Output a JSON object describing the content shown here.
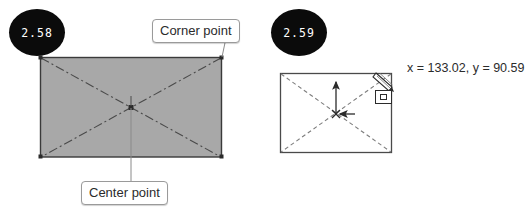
{
  "figures": [
    {
      "badge": "2.58",
      "badge_name": "step-badge-258",
      "callouts": [
        {
          "label": "Corner point",
          "target": "top-right-corner"
        },
        {
          "label": "Center point",
          "target": "rectangle-center"
        }
      ],
      "shape": {
        "type": "rectangle",
        "fill": "#a8a8a8",
        "stroke": "#3a3a3a",
        "diagonals": "dash-dot",
        "markers": [
          "corner-point-markers",
          "center-point-marker"
        ]
      }
    },
    {
      "badge": "2.59",
      "badge_name": "step-badge-259",
      "coordinate_readout": "x = 133.02, y = 90.59",
      "coordinates": {
        "x": 133.02,
        "y": 90.59
      },
      "shape": {
        "type": "rectangle",
        "fill": "#ffffff",
        "stroke": "#4a4a4a",
        "diagonals": "dashed",
        "markers": [
          "center-snap-marker",
          "up-arrow",
          "right-arrow"
        ]
      },
      "cursor": {
        "icon": "pen-cursor-icon",
        "snap_marker": "snap-box-icon"
      }
    }
  ],
  "colors": {
    "badge_background": "#0b0b0b",
    "badge_text": "#ffffff",
    "rect_fill_gray": "#a8a8a8",
    "rect_stroke": "#3a3a3a",
    "callout_border": "#9a9a9a",
    "text": "#2b2b2b",
    "page_background": "#ffffff"
  }
}
